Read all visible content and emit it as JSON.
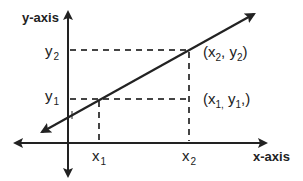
{
  "diagram": {
    "type": "coordinate-line-graph",
    "axes": {
      "x_label": "x-axis",
      "y_label": "y-axis"
    },
    "ticks": {
      "x": [
        {
          "base": "x",
          "sub": "1"
        },
        {
          "base": "x",
          "sub": "2"
        }
      ],
      "y": [
        {
          "base": "y",
          "sub": "1"
        },
        {
          "base": "y",
          "sub": "2"
        }
      ]
    },
    "points": [
      {
        "label_prefix": "(x",
        "sub_x": "1,",
        "mid": " y",
        "sub_y": "1",
        "suffix": ",)"
      },
      {
        "label_prefix": "(x",
        "sub_x": "2",
        "mid": ", y",
        "sub_y": "2",
        "suffix": ")"
      }
    ],
    "colors": {
      "line": "#222222",
      "dashed": "#444444",
      "background": "#ffffff"
    }
  }
}
